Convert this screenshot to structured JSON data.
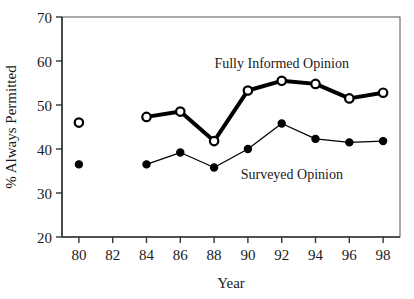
{
  "chart_data": {
    "type": "line",
    "title": "",
    "subtitle": "",
    "xlabel": "Year",
    "ylabel": "% Always Permitted",
    "x": [
      80,
      84,
      86,
      88,
      90,
      92,
      94,
      96,
      98
    ],
    "xlim": [
      79,
      99
    ],
    "ylim": [
      20,
      70
    ],
    "xticks": [
      80,
      82,
      84,
      86,
      88,
      90,
      92,
      94,
      96,
      98
    ],
    "xtick_labels": [
      "80",
      "82",
      "84",
      "86",
      "88",
      "90",
      "92",
      "94",
      "96",
      "98"
    ],
    "yticks": [
      20,
      30,
      40,
      50,
      60,
      70
    ],
    "ytick_labels": [
      "20",
      "30",
      "40",
      "50",
      "60",
      "70"
    ],
    "grid": false,
    "legend_position": "inline-annotation",
    "series": [
      {
        "name": "Fully Informed Opinion",
        "marker": "open-circle",
        "line_width": 4,
        "color": "#000000",
        "label_x": 92,
        "label_y": 58.5,
        "points": [
          {
            "x": 80,
            "y": 46.0,
            "connected": false
          },
          {
            "x": 84,
            "y": 47.3,
            "connected": true
          },
          {
            "x": 86,
            "y": 48.5,
            "connected": true
          },
          {
            "x": 88,
            "y": 41.8,
            "connected": true
          },
          {
            "x": 90,
            "y": 53.3,
            "connected": true
          },
          {
            "x": 92,
            "y": 55.5,
            "connected": true
          },
          {
            "x": 94,
            "y": 54.8,
            "connected": true
          },
          {
            "x": 96,
            "y": 51.5,
            "connected": true
          },
          {
            "x": 98,
            "y": 52.8,
            "connected": true
          }
        ],
        "values": [
          46.0,
          47.3,
          48.5,
          41.8,
          53.3,
          55.5,
          54.8,
          51.5,
          52.8
        ]
      },
      {
        "name": "Surveyed Opinion",
        "marker": "filled-circle",
        "line_width": 1.3,
        "color": "#000000",
        "label_x": 92.6,
        "label_y": 33.2,
        "points": [
          {
            "x": 80,
            "y": 36.5,
            "connected": false
          },
          {
            "x": 84,
            "y": 36.5,
            "connected": true
          },
          {
            "x": 86,
            "y": 39.2,
            "connected": true
          },
          {
            "x": 88,
            "y": 35.8,
            "connected": true
          },
          {
            "x": 90,
            "y": 40.0,
            "connected": true
          },
          {
            "x": 92,
            "y": 45.8,
            "connected": true
          },
          {
            "x": 94,
            "y": 42.3,
            "connected": true
          },
          {
            "x": 96,
            "y": 41.5,
            "connected": true
          },
          {
            "x": 98,
            "y": 41.8,
            "connected": true
          }
        ],
        "values": [
          36.5,
          36.5,
          39.2,
          35.8,
          40.0,
          45.8,
          42.3,
          41.5,
          41.8
        ]
      }
    ]
  },
  "axes": {
    "x_axis_title": "Year",
    "y_axis_title": "% Always Permitted"
  },
  "annotations": {
    "fully_informed": "Fully Informed Opinion",
    "surveyed": "Surveyed Opinion"
  },
  "colors": {
    "axis": "#555555",
    "line": "#000000",
    "text": "#1a1a1a",
    "background": "#ffffff"
  }
}
